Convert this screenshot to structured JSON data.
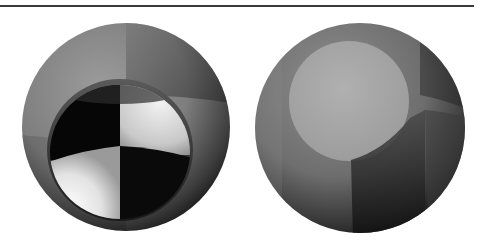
{
  "figure": {
    "panels": [
      {
        "id": "left-sphere",
        "content": "Gray sphere with a recessed inner sphere showing a black/white checkerboard quadrant pattern",
        "colors": {
          "outer": "#8a8a8a",
          "dark_quadrant": "#050505",
          "light_quadrant": "#e8e8e8"
        }
      },
      {
        "id": "right-sphere",
        "content": "Gray sphere with a lighter circular disk patch on the upper left and darker vertical bands on the lower right",
        "colors": {
          "outer": "#7a7a7a",
          "disk": "#a9a9a9",
          "dark_band": "#2a2a2a"
        }
      }
    ]
  }
}
